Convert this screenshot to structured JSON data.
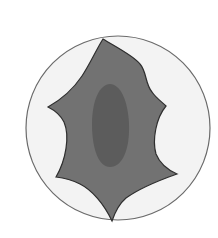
{
  "diagram": {
    "type": "cell-illustration",
    "labels": [],
    "colors": {
      "background": "#ffffff",
      "dish_fill": "#f3f3f3",
      "dish_stroke": "#6a6a6a",
      "cell_fill": "#727272",
      "cell_stroke": "#2e2e2e",
      "nucleus_fill": "#5c5c5c"
    },
    "elements": [
      {
        "name": "petri-dish",
        "shape": "circle"
      },
      {
        "name": "cell-body",
        "shape": "concave-polygon"
      },
      {
        "name": "nucleus",
        "shape": "ellipse"
      }
    ]
  }
}
